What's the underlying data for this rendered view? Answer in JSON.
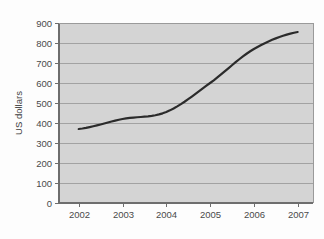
{
  "chart_data": {
    "type": "line",
    "title": "",
    "subtitle": "",
    "xlabel": "",
    "ylabel": "US dollars",
    "x": [
      2002,
      2003,
      2004,
      2005,
      2006,
      2007
    ],
    "categories": [
      "2002",
      "2003",
      "2004",
      "2005",
      "2006",
      "2007"
    ],
    "values": [
      370,
      420,
      455,
      600,
      770,
      855
    ],
    "series": [
      {
        "name": "US dollars",
        "values": [
          370,
          420,
          455,
          600,
          770,
          855
        ]
      }
    ],
    "xlim": [
      2001.55,
      2007.35
    ],
    "ylim": [
      0,
      900
    ],
    "ytick_labels": [
      "0",
      "100",
      "200",
      "300",
      "400",
      "500",
      "600",
      "700",
      "800",
      "900"
    ],
    "ytick_values": [
      0,
      100,
      200,
      300,
      400,
      500,
      600,
      700,
      800,
      900
    ],
    "xtick_labels": [
      "2002",
      "2003",
      "2004",
      "2005",
      "2006",
      "2007"
    ],
    "grid": "horizontal",
    "legend": "none",
    "colors": {
      "line": "#2b2b2b",
      "plot_background": "#d4d4d4",
      "grid": "#a8a8a8",
      "axis": "#6e6e6e",
      "text": "#4a4a4a",
      "figure_background": "#ffffff"
    },
    "line_width": 2.2
  },
  "axes": {
    "y_title": "US dollars",
    "y_ticks": [
      {
        "label": "900",
        "value": 900
      },
      {
        "label": "800",
        "value": 800
      },
      {
        "label": "700",
        "value": 700
      },
      {
        "label": "600",
        "value": 600
      },
      {
        "label": "500",
        "value": 500
      },
      {
        "label": "400",
        "value": 400
      },
      {
        "label": "300",
        "value": 300
      },
      {
        "label": "200",
        "value": 200
      },
      {
        "label": "100",
        "value": 100
      },
      {
        "label": "0",
        "value": 0
      }
    ],
    "x_ticks": [
      {
        "label": "2002",
        "value": 2002
      },
      {
        "label": "2003",
        "value": 2003
      },
      {
        "label": "2004",
        "value": 2004
      },
      {
        "label": "2005",
        "value": 2005
      },
      {
        "label": "2006",
        "value": 2006
      },
      {
        "label": "2007",
        "value": 2007
      }
    ]
  }
}
